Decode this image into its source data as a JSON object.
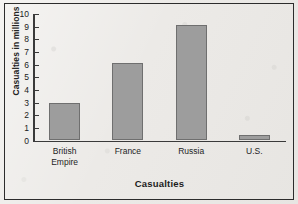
{
  "chart_data": {
    "type": "bar",
    "title": "",
    "xlabel": "Casualties",
    "ylabel": "Casualties in millions",
    "categories": [
      "British\nEmpire",
      "France",
      "Russia",
      "U.S."
    ],
    "values": [
      3.0,
      6.1,
      9.1,
      0.45
    ],
    "ylim": [
      0,
      10
    ],
    "ytick_values": [
      0,
      1,
      2,
      3,
      4,
      5,
      6,
      7,
      8,
      9,
      10
    ],
    "ytick_labels": [
      "0",
      "1",
      "2",
      "3",
      "4",
      "5",
      "6",
      "7",
      "8",
      "9",
      "10"
    ],
    "grid": false,
    "legend": null,
    "bar_color": "#9d9d9d",
    "bar_edge_color": "#6f6f6f",
    "axis_color": "#3a3a3a",
    "background_color": "#eceae7",
    "border_color": "#2c2c2c"
  }
}
